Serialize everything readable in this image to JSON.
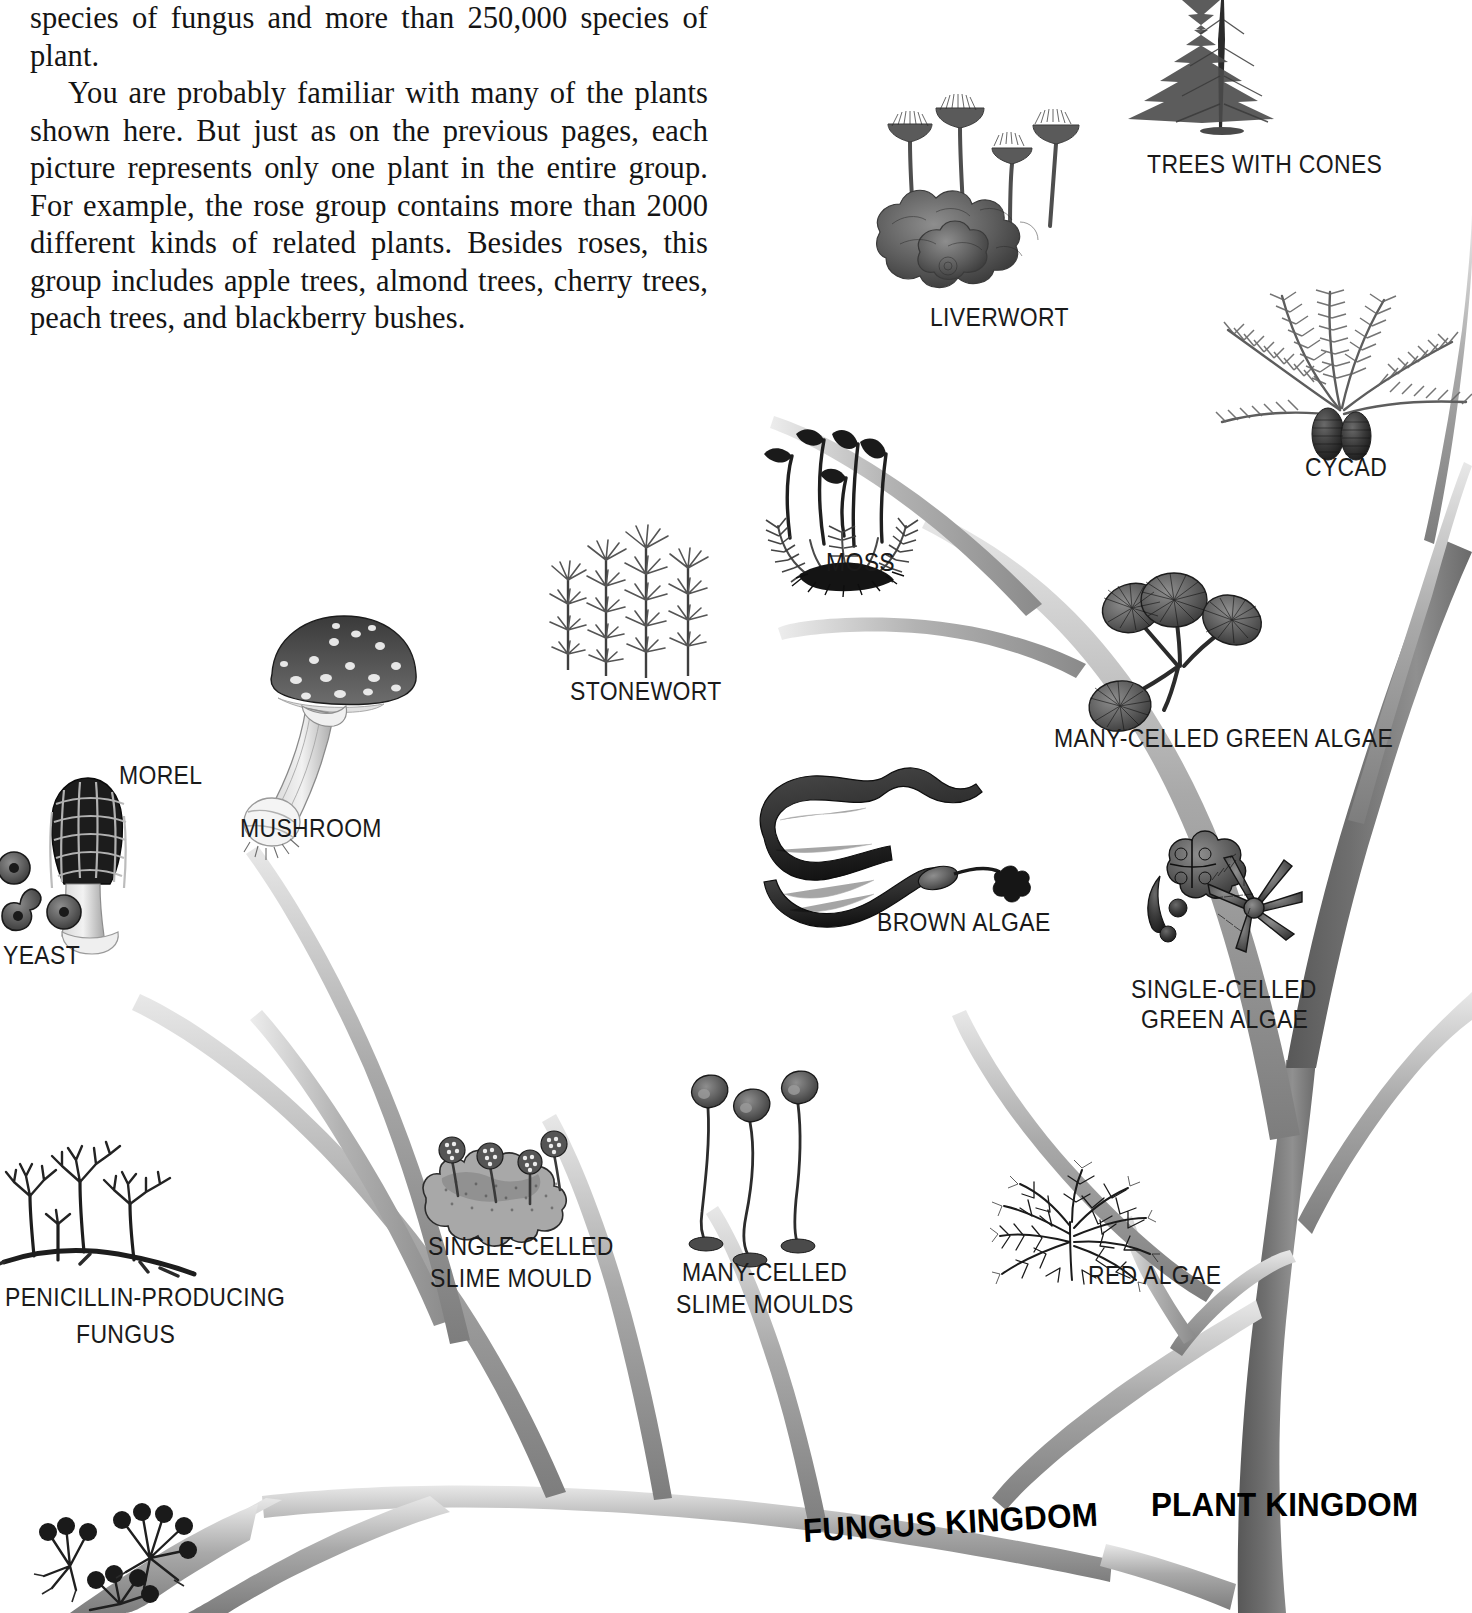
{
  "page": {
    "background": "#ffffff",
    "text_color": "#141414",
    "label_color": "#1a1a1a"
  },
  "body_text": {
    "paragraphs": [
      "species of fungus and more than 250,000 species of plant.",
      "You are probably familiar with many of the plants shown here. But just as on the previous pages, each picture represents only one plant in the entire group. For example, the rose group contains more than 2000 different kinds of related plants. Besides roses, this group includes apple trees, almond trees, cherry trees, peach trees, and blackberry bushes."
    ]
  },
  "kingdoms": [
    {
      "id": "fungus-kingdom",
      "label": "FUNGUS KINGDOM"
    },
    {
      "id": "plant-kingdom",
      "label": "PLANT KINGDOM"
    }
  ],
  "specimens": [
    {
      "id": "trees-with-cones",
      "label": "TREES WITH CONES",
      "kingdom": "plant"
    },
    {
      "id": "liverwort",
      "label": "LIVERWORT",
      "kingdom": "plant"
    },
    {
      "id": "cycad",
      "label": "CYCAD",
      "kingdom": "plant"
    },
    {
      "id": "moss",
      "label": "MOSS",
      "kingdom": "plant"
    },
    {
      "id": "stonewort",
      "label": "STONEWORT",
      "kingdom": "plant"
    },
    {
      "id": "many-celled-green-algae",
      "label": "MANY-CELLED GREEN ALGAE",
      "kingdom": "plant"
    },
    {
      "id": "single-celled-green-algae",
      "label": "SINGLE-CELLED\nGREEN ALGAE",
      "kingdom": "plant"
    },
    {
      "id": "brown-algae",
      "label": "BROWN ALGAE",
      "kingdom": "plant"
    },
    {
      "id": "red-algae",
      "label": "RED ALGAE",
      "kingdom": "plant"
    },
    {
      "id": "morel",
      "label": "MOREL",
      "kingdom": "fungus"
    },
    {
      "id": "mushroom",
      "label": "MUSHROOM",
      "kingdom": "fungus"
    },
    {
      "id": "yeast",
      "label": "YEAST",
      "kingdom": "fungus"
    },
    {
      "id": "penicillin-producing-fungus",
      "label": "PENICILLIN-PRODUCING\nFUNGUS",
      "kingdom": "fungus"
    },
    {
      "id": "single-celled-slime-mould",
      "label": "SINGLE-CELLED\nSLIME MOULD",
      "kingdom": "fungus"
    },
    {
      "id": "many-celled-slime-moulds",
      "label": "MANY-CELLED\nSLIME MOULDS",
      "kingdom": "fungus"
    }
  ],
  "labels": {
    "trees_with_cones": "TREES WITH CONES",
    "liverwort": "LIVERWORT",
    "cycad": "CYCAD",
    "moss": "MOSS",
    "stonewort": "STONEWORT",
    "many_celled_green_algae": "MANY-CELLED GREEN ALGAE",
    "single_celled_green_algae_l1": "SINGLE-CELLED",
    "single_celled_green_algae_l2": "GREEN ALGAE",
    "brown_algae": "BROWN ALGAE",
    "red_algae": "RED ALGAE",
    "morel": "MOREL",
    "mushroom": "MUSHROOM",
    "yeast": "YEAST",
    "penicillin_l1": "PENICILLIN-PRODUCING",
    "penicillin_l2": "FUNGUS",
    "single_celled_slime_mould_l1": "SINGLE-CELLED",
    "single_celled_slime_mould_l2": "SLIME MOULD",
    "many_celled_slime_moulds_l1": "MANY-CELLED",
    "many_celled_slime_moulds_l2": "SLIME MOULDS",
    "fungus_kingdom": "FUNGUS KINGDOM",
    "plant_kingdom": "PLANT KINGDOM"
  }
}
